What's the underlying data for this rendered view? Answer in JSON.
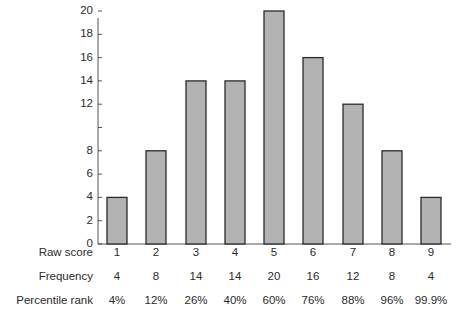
{
  "chart_data": {
    "type": "bar",
    "title": "",
    "xlabel": "Raw score",
    "ylabel": "",
    "categories": [
      "1",
      "2",
      "3",
      "4",
      "5",
      "6",
      "7",
      "8",
      "9"
    ],
    "values": [
      4,
      8,
      14,
      14,
      20,
      16,
      12,
      8,
      4
    ],
    "ylim": [
      0,
      21
    ],
    "y_ticks": [
      0,
      2,
      4,
      6,
      8,
      10,
      12,
      14,
      16,
      18,
      20
    ],
    "y_tick_labels": [
      "0",
      "2",
      "4",
      "6",
      "8",
      "",
      "12",
      "14",
      "16",
      "18",
      "20"
    ],
    "grid": false,
    "legend": null,
    "bar_color": "#b3b3b3",
    "bar_edge_color": "#2b2b2b",
    "table": {
      "rows": [
        {
          "label": "Raw score",
          "values": [
            "1",
            "2",
            "3",
            "4",
            "5",
            "6",
            "7",
            "8",
            "9"
          ]
        },
        {
          "label": "Frequency",
          "values": [
            "4",
            "8",
            "14",
            "14",
            "20",
            "16",
            "12",
            "8",
            "4"
          ]
        },
        {
          "label": "Percentile rank",
          "values": [
            "4%",
            "12%",
            "26%",
            "40%",
            "60%",
            "76%",
            "88%",
            "96%",
            "99.9%"
          ]
        }
      ]
    }
  }
}
